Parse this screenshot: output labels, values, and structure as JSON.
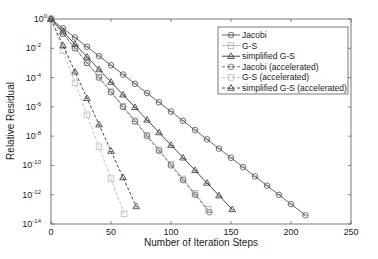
{
  "chart_data": {
    "type": "line",
    "title": "",
    "xlabel": "Number of Iteration Steps",
    "ylabel": "Relative Residual",
    "xlim": [
      0,
      250
    ],
    "ylim_log10": [
      -14,
      0
    ],
    "yscale": "log",
    "grid": false,
    "legend_position": "upper right",
    "x_ticks": [
      0,
      50,
      100,
      150,
      200,
      250
    ],
    "y_ticks": [
      "10^0",
      "10^-2",
      "10^-4",
      "10^-6",
      "10^-8",
      "10^-10",
      "10^-12",
      "10^-14"
    ],
    "series": [
      {
        "name": "Jacobi",
        "color": "#555555",
        "dash": "solid",
        "marker": "circle",
        "x_end": 212,
        "log10_end": -13.4,
        "marker_every": 10
      },
      {
        "name": "G-S",
        "color": "#b0b0b0",
        "dash": "solid",
        "marker": "square",
        "x_end": 131,
        "log10_end": -13.0,
        "marker_every": 10
      },
      {
        "name": "simplified G-S",
        "color": "#333333",
        "dash": "solid",
        "marker": "triangle",
        "x_end": 151,
        "log10_end": -13.0,
        "marker_every": 10
      },
      {
        "name": "Jacobi (accelerated)",
        "color": "#666666",
        "dash": "dashed",
        "marker": "circle",
        "x_end": 132,
        "log10_end": -13.2,
        "marker_every": 10
      },
      {
        "name": "G-S (accelerated)",
        "color": "#b8b8b8",
        "dash": "dashed",
        "marker": "square",
        "x_end": 61,
        "log10_end": -13.3,
        "marker_every": 10
      },
      {
        "name": "simplified G-S (accelerated)",
        "color": "#333333",
        "dash": "dashed",
        "marker": "triangle",
        "x_end": 71,
        "log10_end": -12.8,
        "marker_every": 10
      }
    ]
  },
  "labels": {
    "xlabel": "Number of Iteration Steps",
    "ylabel": "Relative Residual",
    "legend": [
      "Jacobi",
      "G-S",
      "simplified G-S",
      "Jacobi (accelerated)",
      "G-S (accelerated)",
      "simplified G-S (accelerated)"
    ]
  }
}
